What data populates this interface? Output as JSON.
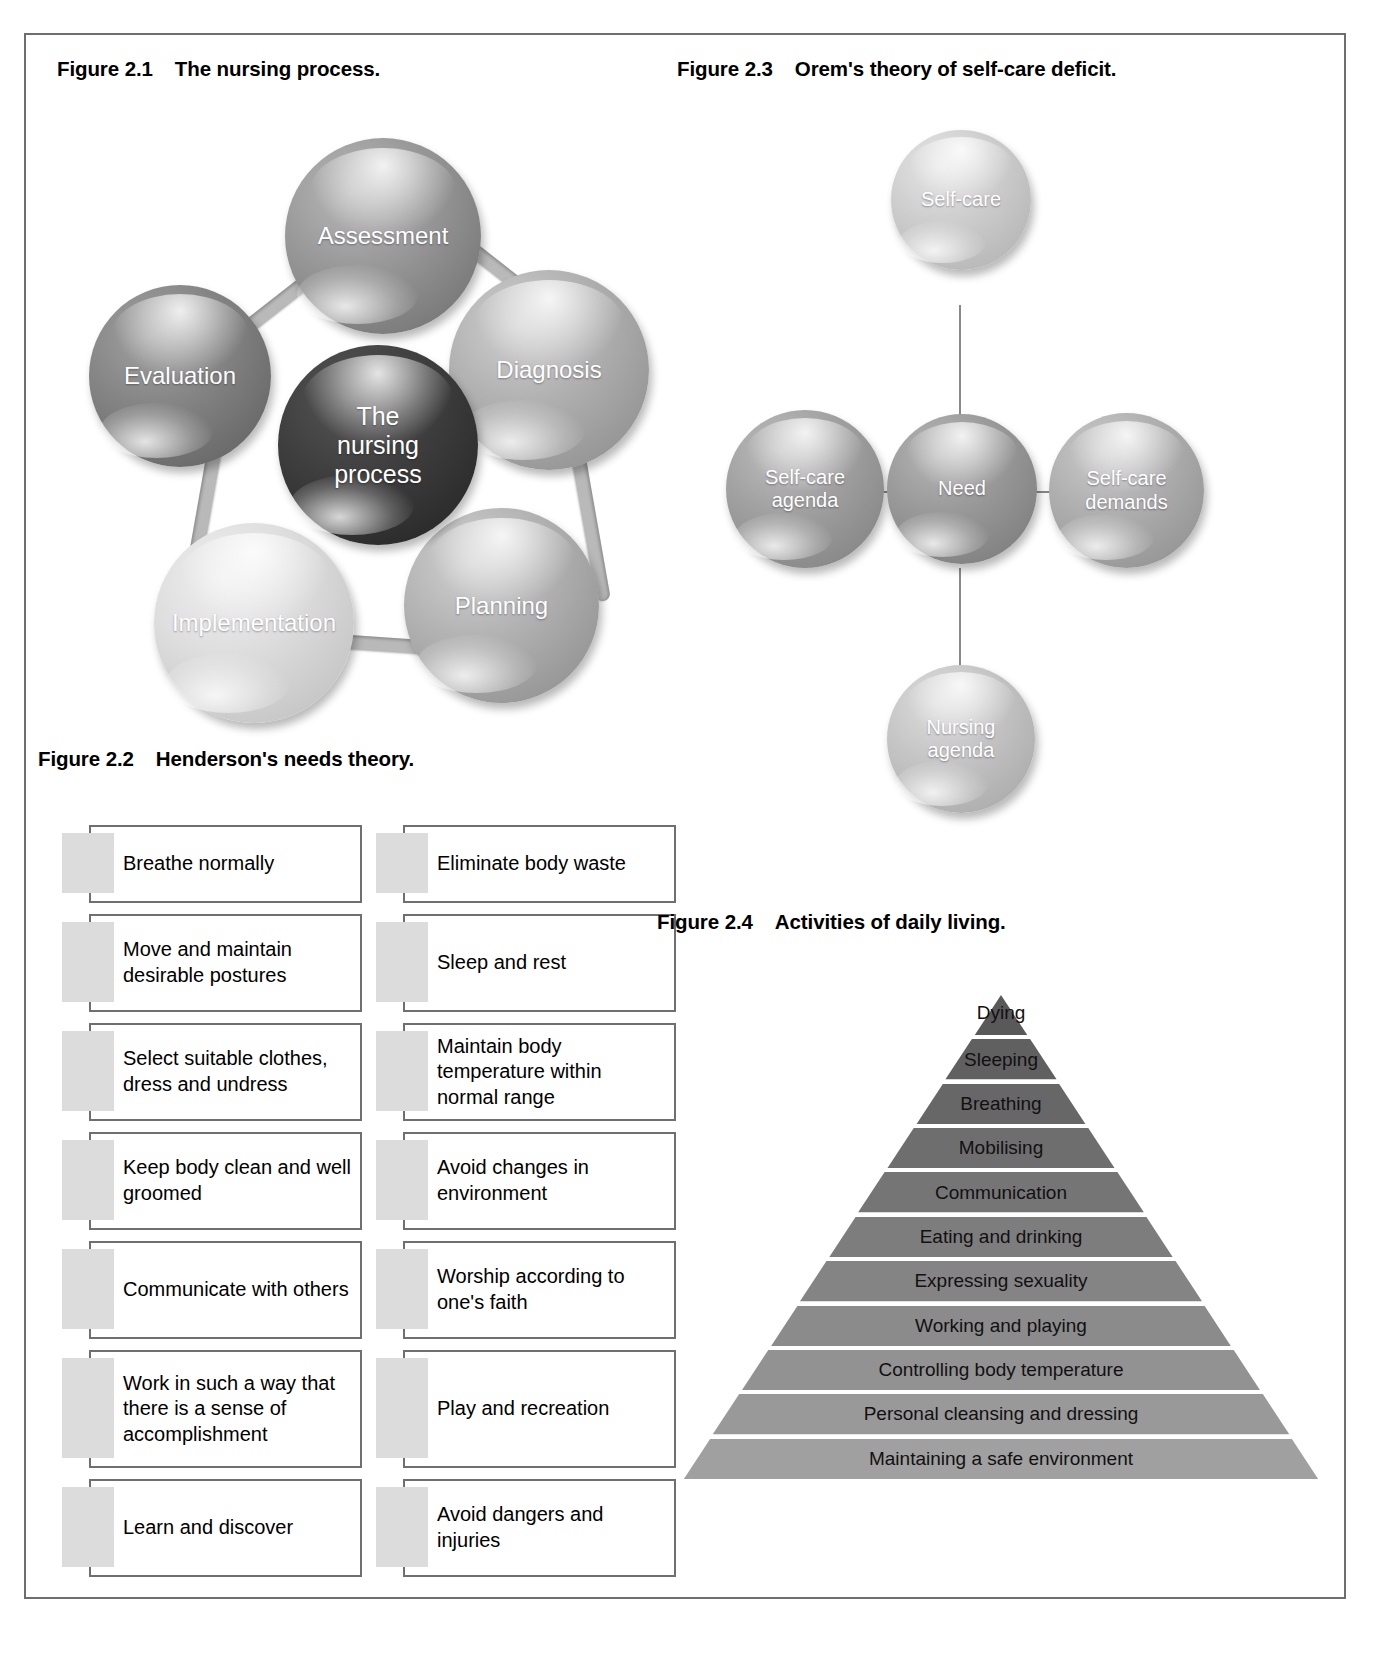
{
  "figures": {
    "fig21": {
      "number": "Figure 2.1",
      "title": "The nursing process.",
      "center": "The\nnursing\nprocess",
      "center_line1": "The",
      "center_line2": "nursing",
      "center_line3": "process",
      "nodes": [
        {
          "label": "Assessment",
          "color": "#8f8f8f"
        },
        {
          "label": "Diagnosis",
          "color": "#a5a5a5"
        },
        {
          "label": "Planning",
          "color": "#a8a8a8"
        },
        {
          "label": "Implementation",
          "color": "#d2d2d2"
        },
        {
          "label": "Evaluation",
          "color": "#7e7e7e"
        }
      ],
      "center_color": "#3a3a3a"
    },
    "fig23": {
      "number": "Figure 2.3",
      "title": "Orem's theory of self-care deficit.",
      "center": {
        "label": "Need",
        "color": "#939393"
      },
      "top": {
        "label": "Self-care",
        "color": "#c0c0c0"
      },
      "left": {
        "label": "Self-care\nagenda",
        "line1": "Self-care",
        "line2": "agenda",
        "color": "#9a9a9a"
      },
      "right": {
        "label": "Self-care\ndemands",
        "line1": "Self-care",
        "line2": "demands",
        "color": "#aaaaaa"
      },
      "bottom": {
        "label": "Nursing\nagenda",
        "line1": "Nursing",
        "line2": "agenda",
        "color": "#bdbdbd"
      }
    },
    "fig22": {
      "number": "Figure 2.2",
      "title": "Henderson's needs theory.",
      "left_column": [
        "Breathe normally",
        "Move and maintain desirable postures",
        "Select suitable clothes, dress and undress",
        "Keep body clean and well groomed",
        "Communicate with others",
        "Work in such a way that there is a sense of accomplishment",
        "Learn and discover"
      ],
      "right_column": [
        "Eliminate body waste",
        "Sleep and rest",
        "Maintain body temperature within normal range",
        "Avoid changes in environment",
        "Worship according to one's faith",
        "Play and recreation",
        "Avoid dangers and injuries"
      ]
    },
    "fig24": {
      "number": "Figure 2.4",
      "title": "Activities of daily living.",
      "levels": [
        "Dying",
        "Sleeping",
        "Breathing",
        "Mobilising",
        "Communication",
        "Eating and drinking",
        "Expressing sexuality",
        "Working and playing",
        "Controlling body temperature",
        "Personal cleansing and dressing",
        "Maintaining a safe environment"
      ]
    }
  },
  "colors": {
    "frame_border": "#6e6e6e",
    "box_border": "#6f6f6f",
    "tab_fill": "#dcdcdc",
    "pyramid_dark": "#595959",
    "pyramid_light": "#a0a0a0",
    "connector": "#b9b9b9"
  }
}
